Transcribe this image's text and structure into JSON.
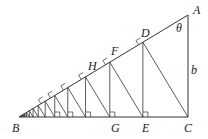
{
  "diagram": {
    "type": "geometry",
    "colors": {
      "line": "#333333",
      "background": "#ffffff"
    },
    "labels": {
      "A": "A",
      "B": "B",
      "C": "C",
      "D": "D",
      "E": "E",
      "F": "F",
      "G": "G",
      "H": "H",
      "theta": "θ",
      "b": "b"
    },
    "points": {
      "A": [
        188,
        15
      ],
      "B": [
        19,
        117
      ],
      "C": [
        188,
        117
      ]
    },
    "ratio": 0.752,
    "segment_count": 14
  }
}
